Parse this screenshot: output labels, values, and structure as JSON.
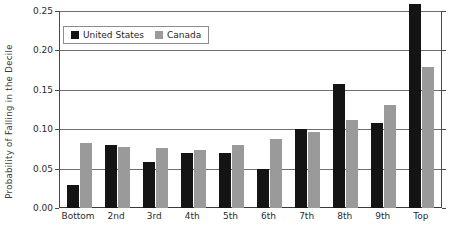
{
  "chart_data": {
    "type": "bar",
    "title": "",
    "xlabel": "",
    "ylabel": "Probability of Falling in the Decile",
    "ylim": [
      0.0,
      0.25
    ],
    "yticks": [
      "0.00",
      "0.05",
      "0.10",
      "0.15",
      "0.20",
      "0.25"
    ],
    "ytick_values": [
      0.0,
      0.05,
      0.1,
      0.15,
      0.2,
      0.25
    ],
    "grid": true,
    "legend_position": "upper-left-inside",
    "categories": [
      "Bottom",
      "2nd",
      "3rd",
      "4th",
      "5th",
      "6th",
      "7th",
      "8th",
      "9th",
      "Top"
    ],
    "series": [
      {
        "name": "United States",
        "color": "#141414",
        "values": [
          0.029,
          0.08,
          0.059,
          0.07,
          0.07,
          0.05,
          0.1,
          0.158,
          0.108,
          0.259
        ]
      },
      {
        "name": "Canada",
        "color": "#9a9a9a",
        "values": [
          0.083,
          0.078,
          0.076,
          0.073,
          0.08,
          0.087,
          0.097,
          0.112,
          0.131,
          0.179
        ]
      }
    ]
  },
  "legend": {
    "entries": [
      {
        "label": "United States",
        "swatch": "black-square-swatch"
      },
      {
        "label": "Canada",
        "swatch": "gray-square-swatch"
      }
    ]
  }
}
